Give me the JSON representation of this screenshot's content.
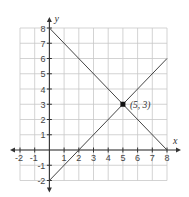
{
  "chart_data": {
    "type": "line",
    "title": "",
    "xlabel": "x",
    "ylabel": "y",
    "xlim": [
      -2,
      8
    ],
    "ylim": [
      -2,
      8
    ],
    "grid": true,
    "x_ticks": [
      -2,
      -1,
      1,
      2,
      3,
      4,
      5,
      6,
      7,
      8
    ],
    "y_ticks": [
      -2,
      -1,
      1,
      2,
      3,
      4,
      5,
      6,
      7,
      8
    ],
    "series": [
      {
        "name": "line-decreasing",
        "points": [
          [
            0,
            8
          ],
          [
            8,
            0
          ]
        ],
        "equation": "y = -x + 8"
      },
      {
        "name": "line-increasing",
        "points": [
          [
            0,
            -2
          ],
          [
            8,
            6
          ]
        ],
        "equation": "y = x - 2"
      }
    ],
    "annotations": [
      {
        "type": "point",
        "x": 5,
        "y": 3,
        "label": "(5, 3)"
      }
    ]
  },
  "labels": {
    "x_axis": "x",
    "y_axis": "y",
    "intersection": "(5, 3)"
  }
}
